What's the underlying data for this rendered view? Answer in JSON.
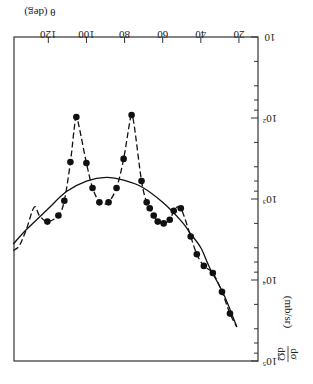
{
  "chart_data": {
    "type": "scatter",
    "orientation_note": "figure is displayed rotated 180 degrees",
    "title": "",
    "xlabel": "θ (deg)",
    "ylabel_numerator": "dσ",
    "ylabel_denominator": "dΩ",
    "ylabel_units": "(mb/sr)",
    "ylabel": "dσ/dΩ (mb/sr)",
    "x_scale": "linear",
    "y_scale": "log",
    "xlim": [
      10,
      138
    ],
    "ylim": [
      10,
      100000
    ],
    "x_ticks": [
      20,
      40,
      60,
      80,
      100,
      120
    ],
    "x_tick_labels": [
      "20",
      "40",
      "60",
      "80",
      "100",
      "120"
    ],
    "y_ticks": [
      10,
      100,
      1000,
      10000,
      100000
    ],
    "y_tick_labels": [
      {
        "base": "10",
        "exp": ""
      },
      {
        "base": "10",
        "exp": "2"
      },
      {
        "base": "10",
        "exp": "3"
      },
      {
        "base": "10",
        "exp": "4"
      },
      {
        "base": "10",
        "exp": "5"
      }
    ],
    "grid": false,
    "series": [
      {
        "name": "data",
        "style": "filled-circles",
        "points": [
          [
            120.5,
            1900
          ],
          [
            114.7,
            1600
          ],
          [
            111.6,
            1050
          ],
          [
            108.4,
            350
          ],
          [
            105.3,
            97
          ],
          [
            100.0,
            360
          ],
          [
            96.8,
            730
          ],
          [
            93.2,
            1100
          ],
          [
            88.4,
            1100
          ],
          [
            84.2,
            730
          ],
          [
            80.5,
            320
          ],
          [
            76.3,
            92
          ],
          [
            71.1,
            600
          ],
          [
            68.4,
            1100
          ],
          [
            66.8,
            1300
          ],
          [
            64.7,
            1600
          ],
          [
            62.6,
            1900
          ],
          [
            59.5,
            2000
          ],
          [
            56.3,
            1800
          ],
          [
            54.2,
            1400
          ],
          [
            50.5,
            1300
          ],
          [
            45.3,
            2900
          ],
          [
            42.1,
            4800
          ],
          [
            38.4,
            6700
          ],
          [
            33.7,
            8200
          ],
          [
            28.9,
            14000
          ],
          [
            24.7,
            26000
          ]
        ]
      },
      {
        "name": "dashed-fit",
        "style": "dashed-line",
        "points": [
          [
            138.4,
            4300
          ],
          [
            135.3,
            3800
          ],
          [
            131.6,
            2400
          ],
          [
            127.4,
            1260
          ],
          [
            124.7,
            1600
          ],
          [
            120.5,
            1900
          ],
          [
            114.7,
            1600
          ],
          [
            111.6,
            1050
          ],
          [
            108.4,
            350
          ],
          [
            106.5,
            140
          ],
          [
            105.3,
            97
          ],
          [
            103.5,
            140
          ],
          [
            100.0,
            360
          ],
          [
            96.8,
            730
          ],
          [
            93.2,
            1100
          ],
          [
            90.8,
            1150
          ],
          [
            88.4,
            1100
          ],
          [
            84.2,
            730
          ],
          [
            80.5,
            320
          ],
          [
            77.5,
            120
          ],
          [
            76.3,
            92
          ],
          [
            74.8,
            130
          ],
          [
            71.1,
            600
          ],
          [
            68.4,
            1100
          ],
          [
            66.8,
            1300
          ],
          [
            64.7,
            1600
          ],
          [
            62.6,
            1900
          ],
          [
            59.5,
            2000
          ],
          [
            56.3,
            1800
          ],
          [
            54.2,
            1400
          ],
          [
            52.3,
            1250
          ],
          [
            50.5,
            1300
          ],
          [
            48.5,
            1700
          ],
          [
            45.3,
            2900
          ],
          [
            42.1,
            4800
          ],
          [
            38.4,
            6700
          ],
          [
            33.7,
            8200
          ],
          [
            28.9,
            14000
          ],
          [
            24.7,
            26000
          ],
          [
            21.1,
            38000
          ]
        ]
      },
      {
        "name": "solid-fit",
        "style": "solid-line",
        "points": [
          [
            138.4,
            3600
          ],
          [
            131.6,
            2400
          ],
          [
            120.5,
            1350
          ],
          [
            110.5,
            810
          ],
          [
            100.0,
            600
          ],
          [
            89.5,
            540
          ],
          [
            80.0,
            590
          ],
          [
            70.5,
            720
          ],
          [
            60.0,
            1100
          ],
          [
            50.0,
            1900
          ],
          [
            45.8,
            2600
          ],
          [
            40.0,
            4000
          ],
          [
            35.3,
            7100
          ],
          [
            28.0,
            15000
          ],
          [
            21.1,
            38000
          ]
        ]
      }
    ]
  }
}
